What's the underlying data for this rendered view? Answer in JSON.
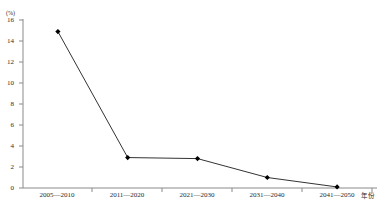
{
  "chart_data": {
    "type": "line",
    "title": "",
    "subtitle": "",
    "xlabel": "年份",
    "ylabel": "(%)",
    "unit_note": "(%)",
    "categories": [
      "2005—2010",
      "2011—2020",
      "2021—2030",
      "2031—2040",
      "2041—2050"
    ],
    "values": [
      14.9,
      2.9,
      2.8,
      1.0,
      0.1
    ],
    "series": [
      {
        "name": "",
        "values": [
          14.9,
          2.9,
          2.8,
          1.0,
          0.1
        ]
      }
    ],
    "ylim": [
      0,
      16
    ],
    "yticks": [
      0,
      2,
      4,
      6,
      8,
      10,
      12,
      14,
      16
    ],
    "ytick_labels": [
      "0",
      "2",
      "4",
      "6",
      "8",
      "10",
      "12",
      "14",
      "16"
    ],
    "xtick_labels": [
      "2005—2010",
      "2011—2020",
      "2021—2030",
      "2031—2040",
      "2041—2050"
    ],
    "grid": false,
    "legend": false,
    "legend_position": "none",
    "marker": "diamond",
    "line_color": "#333333",
    "marker_color": "#000000",
    "axis_color": "#8a8a8a",
    "background_color": "#ffffff"
  },
  "axes": {
    "y_unit_label": "(%)",
    "x_axis_title": "年份"
  }
}
